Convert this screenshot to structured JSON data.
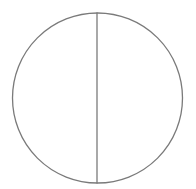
{
  "diagram": {
    "shape": "circle-with-vertical-diameter",
    "circle": {
      "cx": 97.5,
      "cy": 98,
      "r": 85
    },
    "diameter": {
      "x": 97,
      "y1": 12,
      "y2": 184
    },
    "stroke_color": "#7a7a7a",
    "background": "#ffffff"
  }
}
